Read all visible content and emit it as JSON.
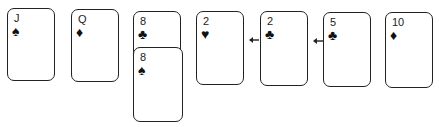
{
  "cards": [
    {
      "rank": "J",
      "suit": "♠",
      "suit_name": "spades"
    },
    {
      "rank": "Q",
      "suit": "♦",
      "suit_name": "diamonds"
    },
    {
      "rank": "8",
      "suit": "♣",
      "suit_name": "clubs"
    },
    {
      "rank": "8",
      "suit": "♠",
      "suit_name": "spades"
    },
    {
      "rank": "2",
      "suit": "♥",
      "suit_name": "hearts"
    },
    {
      "rank": "2",
      "suit": "♣",
      "suit_name": "clubs"
    },
    {
      "rank": "5",
      "suit": "♣",
      "suit_name": "clubs"
    },
    {
      "rank": "10",
      "suit": "♦",
      "suit_name": "diamonds"
    }
  ],
  "arrows": [
    {
      "from": "2♣",
      "to": "2♥",
      "direction": "left"
    },
    {
      "from": "5♣",
      "to": "2♣",
      "direction": "left"
    }
  ]
}
